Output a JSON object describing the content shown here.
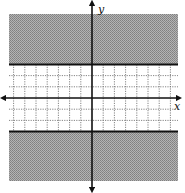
{
  "chart_data": {
    "type": "area",
    "title": "",
    "xlabel": "x",
    "ylabel": "y",
    "xlim": [
      -8,
      8
    ],
    "ylim": [
      -8,
      8
    ],
    "grid": true,
    "grid_style": "dotted",
    "grid_visible_region": "unshaded strip only",
    "boundary_lines": [
      {
        "equation": "y = 3",
        "style": "solid"
      },
      {
        "equation": "y = -3",
        "style": "solid"
      }
    ],
    "shaded_regions": [
      {
        "condition": "y >= 3",
        "fill": "#9a9a9a"
      },
      {
        "condition": "y <= -3",
        "fill": "#9a9a9a"
      }
    ],
    "inequality": "|y| >= 3",
    "axes_arrows": true
  },
  "labels": {
    "x_axis": "x",
    "y_axis": "y"
  },
  "colors": {
    "shade": "#a0a0a0",
    "shade_dark": "#7c7c7c",
    "axis": "#111111",
    "grid": "#666666",
    "background": "#ffffff"
  },
  "geometry": {
    "plot_left": 9,
    "plot_right": 178,
    "plot_top": 14,
    "plot_bottom": 181,
    "origin_x": 92,
    "origin_y": 98,
    "unit_px": 11.2,
    "boundary_upper_y": 3,
    "boundary_lower_y": -3
  }
}
